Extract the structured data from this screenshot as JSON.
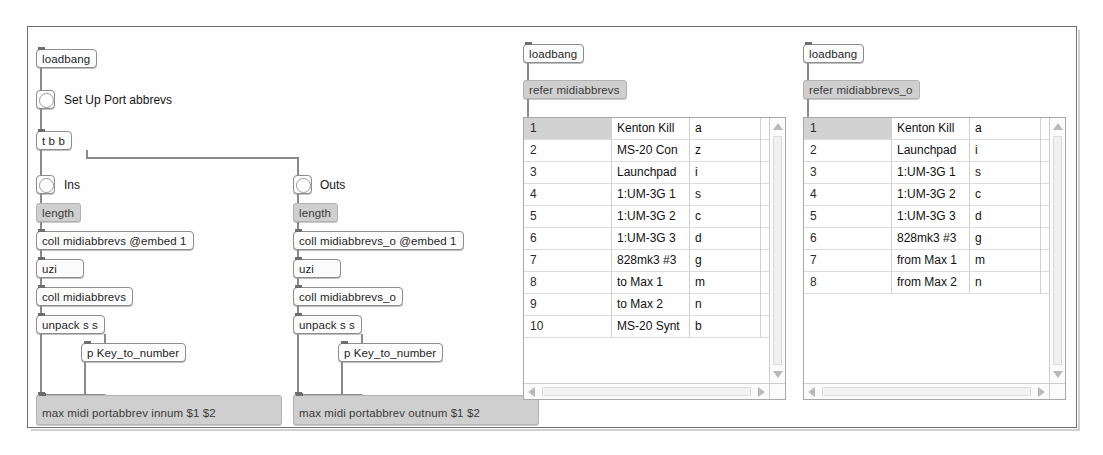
{
  "window": {
    "title": "Max patcher",
    "bg_color": "#fefefe",
    "frame_color": "#6f6f6f"
  },
  "patch": {
    "loadbang_label": "loadbang",
    "comment_setup": "Set Up Port abbrevs",
    "trigger": "t b b",
    "comment_ins": "Ins",
    "comment_outs": "Outs",
    "left_chain": {
      "length_msg": "length",
      "coll_embed": "coll midiabbrevs @embed 1",
      "uzi": "uzi",
      "coll": "coll midiabbrevs",
      "unpack": "unpack s s",
      "subpatch": "p Key_to_number",
      "pack": "pack s i",
      "out_msg": "max midi portabbrev innum $1 $2"
    },
    "right_chain": {
      "length_msg": "length",
      "coll_embed": "coll midiabbrevs_o @embed 1",
      "uzi": "uzi",
      "coll": "coll midiabbrevs_o",
      "unpack": "unpack s s",
      "subpatch": "p Key_to_number",
      "pack": "pack s i",
      "out_msg": "max midi portabbrev outnum $1 $2"
    }
  },
  "coll_editors": [
    {
      "id": "midiabbrevs",
      "loadbang_label": "loadbang",
      "refer_msg": "refer midiabbrevs",
      "selected_index": 1,
      "rows": [
        {
          "index": "1",
          "name": "Kenton Kill",
          "value": "a"
        },
        {
          "index": "2",
          "name": "MS-20 Con",
          "value": "z"
        },
        {
          "index": "3",
          "name": "Launchpad",
          "value": "i"
        },
        {
          "index": "4",
          "name": "1:UM-3G 1",
          "value": "s"
        },
        {
          "index": "5",
          "name": "1:UM-3G 2",
          "value": "c"
        },
        {
          "index": "6",
          "name": "1:UM-3G 3",
          "value": "d"
        },
        {
          "index": "7",
          "name": "828mk3 #3",
          "value": "g"
        },
        {
          "index": "8",
          "name": "to Max 1",
          "value": "m"
        },
        {
          "index": "9",
          "name": "to Max 2",
          "value": "n"
        },
        {
          "index": "10",
          "name": "MS-20 Synt",
          "value": "b"
        }
      ]
    },
    {
      "id": "midiabbrevs_o",
      "loadbang_label": "loadbang",
      "refer_msg": "refer midiabbrevs_o",
      "selected_index": 1,
      "rows": [
        {
          "index": "1",
          "name": "Kenton Kill",
          "value": "a"
        },
        {
          "index": "2",
          "name": "Launchpad",
          "value": "i"
        },
        {
          "index": "3",
          "name": "1:UM-3G 1",
          "value": "s"
        },
        {
          "index": "4",
          "name": "1:UM-3G 2",
          "value": "c"
        },
        {
          "index": "5",
          "name": "1:UM-3G 3",
          "value": "d"
        },
        {
          "index": "6",
          "name": "828mk3 #3",
          "value": "g"
        },
        {
          "index": "7",
          "name": "from Max 1",
          "value": "m"
        },
        {
          "index": "8",
          "name": "from Max 2",
          "value": "n"
        }
      ]
    }
  ],
  "scrollbars": {
    "up_arrow": "scroll-up",
    "down_arrow": "scroll-down",
    "left_arrow": "scroll-left",
    "right_arrow": "scroll-right"
  }
}
